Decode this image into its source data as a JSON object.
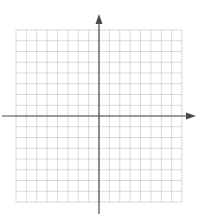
{
  "diagram": {
    "type": "coordinate-plane",
    "grid": {
      "columns": 16,
      "rows": 16,
      "left": 16,
      "top": 30,
      "right": 182,
      "bottom": 202
    },
    "x_axis": {
      "y": 116,
      "x_start": 2,
      "x_end": 196,
      "arrow": "right"
    },
    "y_axis": {
      "x": 99,
      "y_start": 214,
      "y_end": 14,
      "arrow": "up"
    },
    "colors": {
      "grid": "#cfcfcf",
      "axis": "#4a4a4a",
      "background": "#ffffff"
    }
  }
}
